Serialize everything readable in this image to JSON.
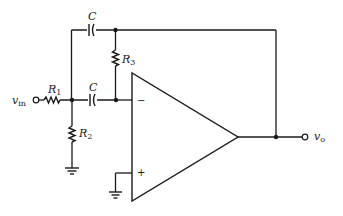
{
  "diagram": {
    "type": "op-amp active filter circuit",
    "labels": {
      "input": "v",
      "input_sub": "in",
      "output": "v",
      "output_sub": "o",
      "r1": "R",
      "r1_sub": "1",
      "r2": "R",
      "r2_sub": "2",
      "r3": "R",
      "r3_sub": "3",
      "c_top": "C",
      "c_bottom": "C",
      "inv_input": "−",
      "noninv_input": "+"
    },
    "components": [
      {
        "id": "R1",
        "type": "resistor",
        "between": [
          "v_in",
          "node_A"
        ]
      },
      {
        "id": "R2",
        "type": "resistor",
        "between": [
          "node_A",
          "ground"
        ]
      },
      {
        "id": "C_bottom",
        "type": "capacitor",
        "between": [
          "node_A",
          "node_B"
        ]
      },
      {
        "id": "C_top",
        "type": "capacitor",
        "between": [
          "node_A",
          "node_C"
        ]
      },
      {
        "id": "R3",
        "type": "resistor",
        "between": [
          "node_C",
          "node_B"
        ]
      },
      {
        "id": "opamp",
        "type": "op-amp",
        "inverting": "node_B",
        "noninverting": "ground",
        "output": "v_o"
      }
    ],
    "feedback": "node_C connected to v_o"
  }
}
